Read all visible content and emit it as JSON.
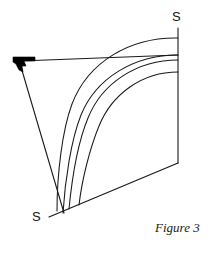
{
  "figure": {
    "caption": "Figure 3",
    "labels": {
      "top_right_s": "S",
      "bottom_left_s": "S"
    },
    "colors": {
      "stroke": "#1a1a1a",
      "fill_marker": "#000000",
      "background": "#ffffff"
    },
    "geometry": {
      "description": "Geometric construction: quadrilateral frame with four concentric arcs sweeping from a vertical right edge to a lower-left diagonal edge, a filled arrowhead marker at the left apex, and S endpoint labels.",
      "apex_point": [
        21,
        62
      ],
      "top_edge": [
        [
          21,
          62
        ],
        [
          178,
          55
        ]
      ],
      "right_vertical_edge": [
        [
          178,
          28
        ],
        [
          178,
          163
        ]
      ],
      "bottom_diagonal_edge": [
        [
          178,
          163
        ],
        [
          50,
          216
        ]
      ],
      "left_diagonal_edge": [
        [
          21,
          66
        ],
        [
          64,
          213
        ]
      ],
      "arcs": [
        {
          "name": "arc-outer",
          "start": [
            178,
            38
          ],
          "end": [
            57,
            211
          ]
        },
        {
          "name": "arc-band-outer",
          "start": [
            178,
            55
          ],
          "end": [
            63,
            213
          ]
        },
        {
          "name": "arc-band-inner",
          "start": [
            178,
            56
          ],
          "end": [
            69,
            209
          ]
        },
        {
          "name": "arc-inner",
          "start": [
            178,
            72
          ],
          "end": [
            79,
            205
          ]
        }
      ],
      "arrow_marker": {
        "name": "filled-arrowhead",
        "position": [
          14,
          57
        ],
        "size": [
          22,
          18
        ]
      }
    }
  }
}
